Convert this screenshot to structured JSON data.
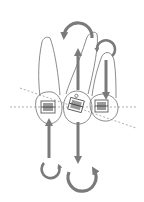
{
  "diagram": {
    "colors": {
      "background": "#ffffff",
      "tooth_outline": "#6e6e6e",
      "arrow": "#7a7a7a",
      "dashed_line": "#8a8a8a",
      "bracket": "#5a5a5a"
    },
    "teeth": [
      {
        "id": "left-tooth",
        "has_bracket": true
      },
      {
        "id": "center-tooth",
        "has_bracket": true
      },
      {
        "id": "right-tooth",
        "has_bracket": true
      }
    ],
    "arrows": [
      {
        "id": "top-rotation",
        "type": "curved",
        "direction": "counterclockwise"
      },
      {
        "id": "center-up",
        "type": "straight",
        "direction": "up"
      },
      {
        "id": "right-rotation",
        "type": "curved",
        "direction": "counterclockwise"
      },
      {
        "id": "right-down",
        "type": "straight",
        "direction": "down"
      },
      {
        "id": "left-up",
        "type": "straight",
        "direction": "up"
      },
      {
        "id": "center-down",
        "type": "straight",
        "direction": "down"
      },
      {
        "id": "bottom-left-rotation",
        "type": "curved",
        "direction": "clockwise"
      },
      {
        "id": "bottom-center-rotation",
        "type": "curved",
        "direction": "clockwise"
      }
    ],
    "reference_lines": [
      {
        "id": "occlusal-horizontal",
        "style": "dashed"
      },
      {
        "id": "occlusal-tilted",
        "style": "dashed"
      }
    ]
  }
}
